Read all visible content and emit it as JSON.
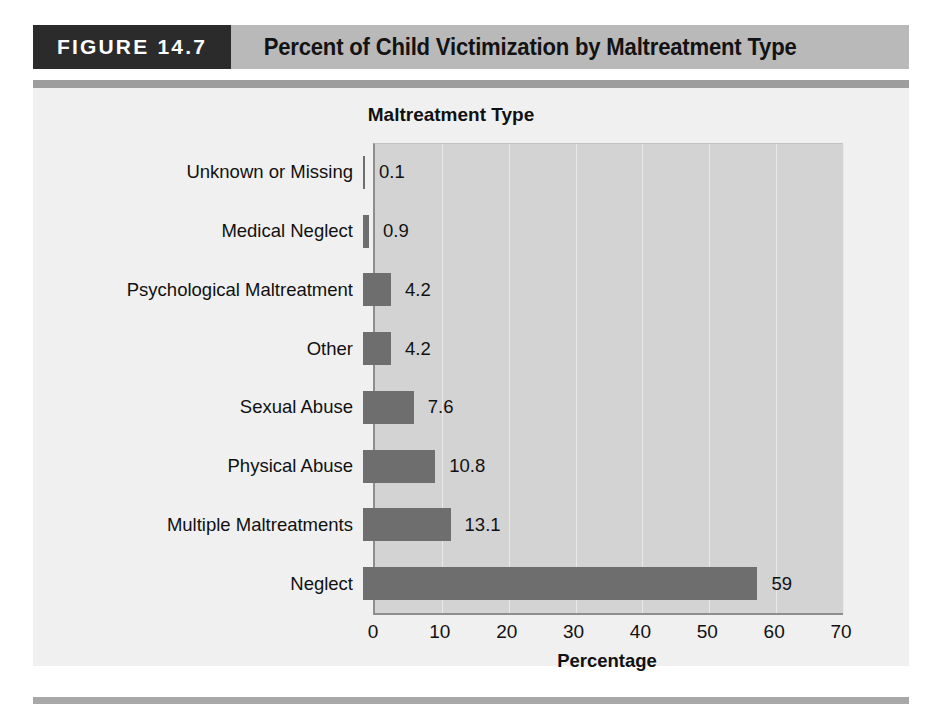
{
  "figure": {
    "tag": "FIGURE 14.7",
    "title": "Percent of Child Victimization by Maltreatment Type"
  },
  "colors": {
    "tag_background": "#2b2b2b",
    "header_background": "#b9b9b9",
    "panel_background": "#f0f0f0",
    "plot_background": "#d3d3d3",
    "bar": "#6e6e6e",
    "gridline": "#e9e9e9",
    "axis": "#8e8e8e"
  },
  "chart_data": {
    "type": "bar",
    "orientation": "horizontal",
    "title": "Percent of Child Victimization by Maltreatment Type",
    "ylabel": "Maltreatment Type",
    "xlabel": "Percentage",
    "categories": [
      "Unknown or Missing",
      "Medical Neglect",
      "Psychological Maltreatment",
      "Other",
      "Sexual Abuse",
      "Physical Abuse",
      "Multiple Maltreatments",
      "Neglect"
    ],
    "values": [
      0.1,
      0.9,
      4.2,
      4.2,
      7.6,
      10.8,
      13.1,
      59
    ],
    "value_labels": [
      "0.1",
      "0.9",
      "4.2",
      "4.2",
      "7.6",
      "10.8",
      "13.1",
      "59"
    ],
    "xlim": [
      0,
      70
    ],
    "xticks": [
      0,
      10,
      20,
      30,
      40,
      50,
      60,
      70
    ],
    "xtick_labels": [
      "0",
      "10",
      "20",
      "30",
      "40",
      "50",
      "60",
      "70"
    ],
    "grid": "vertical",
    "legend": "none"
  }
}
